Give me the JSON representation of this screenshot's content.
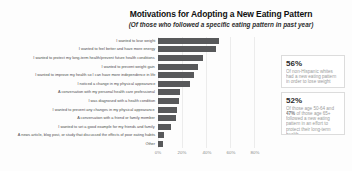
{
  "header": {
    "title": "Motivations for Adopting a New Eating Pattern",
    "subtitle": "(Of those who followed a specific eating pattern in past year)"
  },
  "chart_data": {
    "type": "bar",
    "orientation": "horizontal",
    "title": "Motivations for Adopting a New Eating Pattern",
    "subtitle": "(Of those who followed a specific eating pattern in past year)",
    "categories": [
      "I wanted to lose weight",
      "I wanted to feel better and have more energy",
      "I wanted to protect my long-term health/prevent future health conditions",
      "I wanted to prevent weight gain",
      "I wanted to improve my health so I can have more independence in life",
      "I noticed a change in my physical appearance",
      "A conversation with my personal health care professional",
      "I was diagnosed with a health condition",
      "I wanted to prevent any changes in my physical appearance",
      "A conversation with a friend or family member",
      "I wanted to set a good example for my friends and family",
      "A news article, blog post, or study that discussed the effects of poor eating habits",
      "Other"
    ],
    "values": [
      50,
      48,
      37,
      33,
      30,
      26,
      18,
      17,
      16,
      15,
      11,
      5,
      4
    ],
    "unit": "%",
    "xlim": [
      0,
      80
    ],
    "x_ticks": [
      "0%",
      "20%",
      "40%",
      "60%",
      "80%"
    ],
    "grid": true,
    "legend": false,
    "bar_color": "#58595b",
    "grid_color": "#ececec"
  },
  "callouts": [
    {
      "value": "56%",
      "text": "Of non-Hispanic whites had a new eating pattern in order to lose weight"
    },
    {
      "value": "52%",
      "text_lead": "Of those age 50-64 and ",
      "text_bold": "47%",
      "text_rest": " of those age 65+ followed a new eating pattern in an effort to protect their long-term health"
    }
  ],
  "colors": {
    "background": "#fdfdfd",
    "bar": "#58595b",
    "title_text": "#111111",
    "label_text": "#4d4d4d",
    "tick_text": "#8a8a8a",
    "callout_value_text": "#2b2b2b",
    "callout_body_text": "#9b9b9b",
    "callout_border": "#dcdcdc"
  }
}
